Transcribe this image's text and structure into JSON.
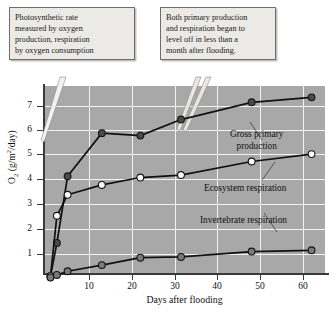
{
  "callouts": [
    {
      "name": "photosynthetic-rate-note",
      "lines": [
        "Photosynthetic rate",
        "measured by oxygen",
        "production, respiration",
        "by oxygen consumption"
      ]
    },
    {
      "name": "leveling-off-note",
      "lines": [
        "Both primary production",
        "and respiration began to",
        "level off in less than a",
        "month after flooding."
      ]
    }
  ],
  "axes": {
    "y_title_main": "O",
    "y_title_sub": "2",
    "y_title_rest": " (g/m",
    "y_title_sup": "2",
    "y_title_tail": "/day)",
    "x_title": "Days after flooding",
    "y_ticks": [
      "1",
      "2",
      "3",
      "4",
      "5",
      "6",
      "7"
    ],
    "x_ticks": [
      "10",
      "20",
      "30",
      "40",
      "50",
      "60"
    ]
  },
  "series_labels": {
    "gpp_line1": "Gross primary",
    "gpp_line2": "production",
    "ecosystem": "Ecosystem respiration",
    "invertebrate": "Invertebrate respiration"
  },
  "colors": {
    "plot_background": "#a8a8a8",
    "gridline": "#f2f2f2",
    "axis": "#3a3a3a",
    "line": "#111111",
    "marker_filled_dark": "#4a4a4a",
    "marker_open": "#ffffff",
    "marker_gray": "#7a7a7a",
    "callout_background": "#eceae6",
    "callout_border": "#6d6d6d"
  },
  "chart_data": {
    "type": "line",
    "title": "",
    "xlabel": "Days after flooding",
    "ylabel": "O2 (g/m2/day)",
    "xlim": [
      0,
      65
    ],
    "ylim": [
      0,
      7.8
    ],
    "grid": true,
    "legend": "inline-labels",
    "series": [
      {
        "name": "Gross primary production",
        "marker": "filled-dark-circle",
        "x": [
          1,
          2.5,
          5,
          13,
          22,
          31.5,
          48,
          62
        ],
        "y": [
          0.1,
          1.45,
          4.15,
          5.9,
          5.8,
          6.45,
          7.15,
          7.35
        ]
      },
      {
        "name": "Ecosystem respiration",
        "marker": "open-circle",
        "x": [
          1,
          2.5,
          5,
          13,
          22,
          31.5,
          48,
          62
        ],
        "y": [
          0.1,
          2.55,
          3.4,
          3.8,
          4.1,
          4.2,
          4.75,
          5.05
        ]
      },
      {
        "name": "Invertebrate respiration",
        "marker": "gray-circle",
        "x": [
          1,
          2.5,
          5,
          13,
          22,
          31.5,
          48,
          62
        ],
        "y": [
          0.05,
          0.15,
          0.3,
          0.55,
          0.85,
          0.88,
          1.1,
          1.15
        ]
      }
    ]
  }
}
